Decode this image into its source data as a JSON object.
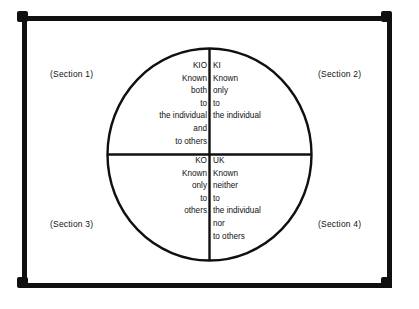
{
  "diagram": {
    "frame_color": "#101010",
    "background_color": "#ffffff",
    "line_color": "#101010"
  },
  "sections": [
    {
      "id": "section-1",
      "label": "(Section 1)"
    },
    {
      "id": "section-2",
      "label": "(Section 2)"
    },
    {
      "id": "section-3",
      "label": "(Section 3)"
    },
    {
      "id": "section-4",
      "label": "(Section 4)"
    }
  ],
  "quadrants": [
    {
      "id": "kio",
      "code": "KIO",
      "position": "upper-left",
      "align": "right",
      "lines": [
        "KIO",
        "Known",
        "both",
        "to",
        "the individual",
        "and",
        "to others"
      ]
    },
    {
      "id": "ki",
      "code": "KI",
      "position": "upper-right",
      "align": "left",
      "lines": [
        "KI",
        "Known",
        "only",
        "to",
        "the individual"
      ]
    },
    {
      "id": "ko",
      "code": "KO",
      "position": "lower-left",
      "align": "right",
      "lines": [
        "KO",
        "Known",
        "only",
        "to",
        "others"
      ]
    },
    {
      "id": "uk",
      "code": "UK",
      "position": "lower-right",
      "align": "left",
      "lines": [
        "UK",
        "Known",
        "neither",
        "to",
        "the individual",
        "nor",
        "to others"
      ]
    }
  ]
}
